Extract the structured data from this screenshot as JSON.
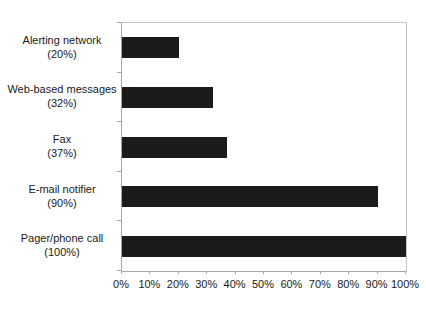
{
  "chart_data": {
    "type": "bar",
    "orientation": "horizontal",
    "title": "",
    "categories": [
      "Alerting network",
      "Web-based messages",
      "Fax",
      "E-mail notifier",
      "Pager/phone call"
    ],
    "values": [
      20,
      32,
      37,
      90,
      100
    ],
    "value_labels": [
      "(20%)",
      "(32%)",
      "(37%)",
      "(90%)",
      "(100%)"
    ],
    "x_tick_labels": [
      "0%",
      "10%",
      "20%",
      "30%",
      "40%",
      "50%",
      "60%",
      "70%",
      "80%",
      "90%",
      "100%"
    ],
    "xlim": [
      0,
      100
    ],
    "x_tick_step": 10,
    "grid": "off",
    "legend": "none",
    "bar_color": "#1b1b1b",
    "axis_color": "#a8a8a8",
    "text_color": "#1a1a1a",
    "background": "#ffffff"
  }
}
